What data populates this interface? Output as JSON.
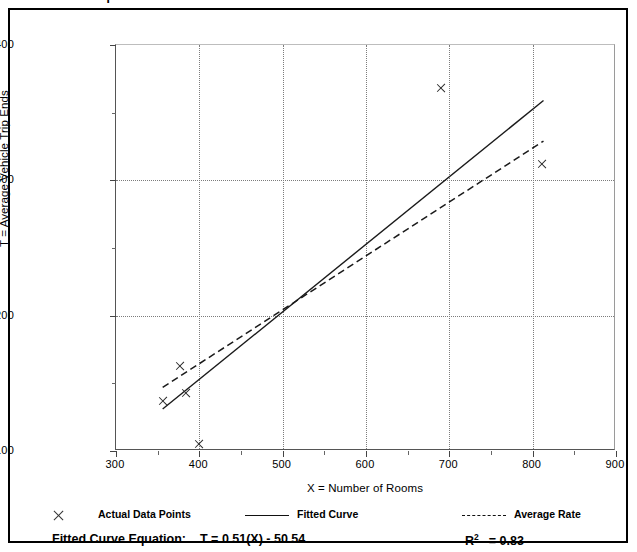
{
  "figure": {
    "title": "Data Plot and Equation"
  },
  "legend": {
    "items": [
      {
        "label": "Actual Data Points",
        "marker": "x-cross-icon"
      },
      {
        "label": "Fitted Curve",
        "marker": "solid-line-icon"
      },
      {
        "label": "Average Rate",
        "marker": "dashed-line-icon"
      }
    ]
  },
  "equation": {
    "fitted_label": "Fitted Curve Equation:",
    "fitted_value": "T = 0.51(X) - 50.54",
    "r_squared_symbol": "R",
    "r_squared_exp": "2",
    "r_squared_value": "= 0.83"
  },
  "chart_data": {
    "type": "scatter",
    "title": "Data Plot and Equation",
    "xlabel": "X = Number of Rooms",
    "ylabel": "T = Average Vehicle Trip Ends",
    "xlim": [
      300,
      900
    ],
    "ylim": [
      100,
      400
    ],
    "xticks": [
      300,
      400,
      500,
      600,
      700,
      800,
      900
    ],
    "yticks": [
      100,
      200,
      300,
      400
    ],
    "x_minor_ticks": [
      350,
      450,
      550,
      650,
      750,
      850
    ],
    "y_minor_ticks": [
      150,
      250,
      350
    ],
    "grid": "dotted-vertical-and-horizontal",
    "legend_position": "below-plot",
    "series": [
      {
        "name": "Actual Data Points",
        "type": "scatter",
        "marker": "x",
        "points": [
          {
            "x": 357,
            "y": 137
          },
          {
            "x": 377,
            "y": 163
          },
          {
            "x": 384,
            "y": 143
          },
          {
            "x": 400,
            "y": 105
          },
          {
            "x": 690,
            "y": 368
          },
          {
            "x": 812,
            "y": 312
          }
        ]
      },
      {
        "name": "Fitted Curve",
        "type": "line",
        "style": "solid",
        "equation": "T = 0.51(X) - 50.54",
        "r_squared": 0.83,
        "endpoints": [
          {
            "x": 356,
            "y": 131
          },
          {
            "x": 813,
            "y": 359
          }
        ]
      },
      {
        "name": "Average Rate",
        "type": "line",
        "style": "dashed",
        "endpoints": [
          {
            "x": 356,
            "y": 147
          },
          {
            "x": 813,
            "y": 329
          }
        ]
      }
    ]
  }
}
